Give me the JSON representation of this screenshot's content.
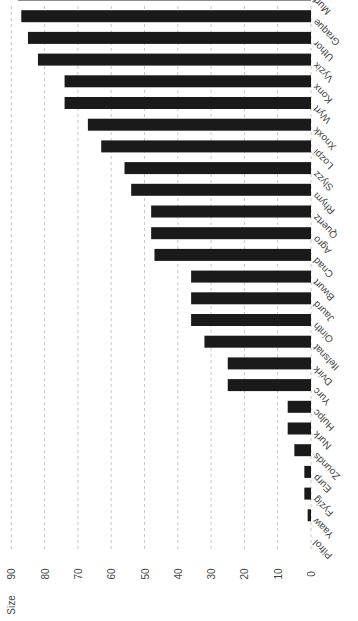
{
  "chart_data": {
    "type": "bar",
    "orientation": "rotated-90",
    "title": "",
    "xlabel": "",
    "ylabel": "Size",
    "ylim": [
      0,
      90
    ],
    "yticks": [
      0,
      10,
      20,
      30,
      40,
      50,
      60,
      70,
      80,
      90
    ],
    "grid": true,
    "bar_color": "#1a1a1a",
    "categories": [
      "Pifrol",
      "Yaaw",
      "Fyzig",
      "Eurp",
      "Zounds",
      "Nurk",
      "Hulpc",
      "Yurc",
      "Dvirk",
      "Ifelsnat",
      "Ointh",
      "Jaurd",
      "Bwurt",
      "Cnad",
      "Agro",
      "Quertz",
      "Rhym",
      "Slyzz",
      "Lozpi",
      "Xnoxk",
      "Wyrt",
      "Konx",
      "Vyzix",
      "Uthor",
      "Graque",
      "Murf"
    ],
    "values": [
      0,
      1,
      2,
      2,
      5,
      7,
      7,
      25,
      25,
      32,
      36,
      36,
      36,
      47,
      48,
      48,
      54,
      56,
      63,
      67,
      74,
      74,
      82,
      85,
      87,
      88
    ]
  }
}
